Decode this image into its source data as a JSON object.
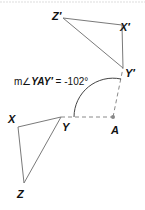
{
  "diagram": {
    "type": "rotation",
    "original_triangle": {
      "vertices": [
        {
          "name": "X",
          "label": "X",
          "x": 18,
          "y": 127
        },
        {
          "name": "Y",
          "label": "Y",
          "x": 61,
          "y": 117
        },
        {
          "name": "Z",
          "label": "Z",
          "x": 24,
          "y": 183
        }
      ]
    },
    "image_triangle": {
      "vertices": [
        {
          "name": "X'",
          "label": "X′",
          "x": 122,
          "y": 25
        },
        {
          "name": "Y'",
          "label": "Y′",
          "x": 123,
          "y": 68
        },
        {
          "name": "Z'",
          "label": "Z′",
          "x": 63,
          "y": 18
        }
      ]
    },
    "center": {
      "label": "A",
      "x": 113,
      "y": 117
    },
    "angle_label": {
      "prefix": "m∠",
      "angle_name": "YAY′",
      "equals": " = ",
      "value": "-102°"
    },
    "colors": {
      "stroke": "#7a7a7a",
      "text": "#111111",
      "dashed": "#8a8a8a",
      "point": "#888888"
    }
  }
}
